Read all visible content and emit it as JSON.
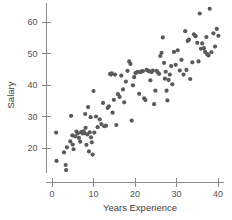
{
  "chart_data": {
    "type": "scatter",
    "title": "",
    "xlabel": "Years Experience",
    "ylabel": "Salary",
    "xlim": [
      -1.5,
      41.5
    ],
    "ylim": [
      12,
      66
    ],
    "xticks": [
      0,
      10,
      20,
      30,
      40
    ],
    "yticks": [
      20,
      30,
      40,
      50,
      60
    ],
    "xtick_labels": [
      "0",
      "10",
      "20",
      "30",
      "40"
    ],
    "ytick_labels": [
      "20",
      "30",
      "40",
      "50",
      "60"
    ],
    "grid": false,
    "legend": null,
    "marker": "circle",
    "marker_color": "#5a5a5a",
    "marker_size": 2.1,
    "n_points": 120,
    "points": [
      [
        1.0,
        24.9
      ],
      [
        1.1,
        15.9
      ],
      [
        2.9,
        18.6
      ],
      [
        3.3,
        14.6
      ],
      [
        3.4,
        13.0
      ],
      [
        3.6,
        20.2
      ],
      [
        4.4,
        22.1
      ],
      [
        4.6,
        30.2
      ],
      [
        4.9,
        24.0
      ],
      [
        5.0,
        21.1
      ],
      [
        5.2,
        19.6
      ],
      [
        5.6,
        23.7
      ],
      [
        5.9,
        25.2
      ],
      [
        6.2,
        24.6
      ],
      [
        6.5,
        23.2
      ],
      [
        6.8,
        22.0
      ],
      [
        7.0,
        25.0
      ],
      [
        7.2,
        25.1
      ],
      [
        7.4,
        24.6
      ],
      [
        7.6,
        25.3
      ],
      [
        7.8,
        24.7
      ],
      [
        8.0,
        30.8
      ],
      [
        8.1,
        26.4
      ],
      [
        8.3,
        21.0
      ],
      [
        8.5,
        24.3
      ],
      [
        8.7,
        33.0
      ],
      [
        8.9,
        18.9
      ],
      [
        9.1,
        25.0
      ],
      [
        9.3,
        29.8
      ],
      [
        9.4,
        23.4
      ],
      [
        9.6,
        21.8
      ],
      [
        9.8,
        17.9
      ],
      [
        10.0,
        38.1
      ],
      [
        10.2,
        24.9
      ],
      [
        10.6,
        30.0
      ],
      [
        11.0,
        26.6
      ],
      [
        11.5,
        29.1
      ],
      [
        11.9,
        27.6
      ],
      [
        12.3,
        34.3
      ],
      [
        12.6,
        26.9
      ],
      [
        13.0,
        27.1
      ],
      [
        13.4,
        32.7
      ],
      [
        13.7,
        33.2
      ],
      [
        14.0,
        43.5
      ],
      [
        14.2,
        43.3
      ],
      [
        14.4,
        43.7
      ],
      [
        14.6,
        31.2
      ],
      [
        14.9,
        35.3
      ],
      [
        15.2,
        43.3
      ],
      [
        15.5,
        27.3
      ],
      [
        15.9,
        37.1
      ],
      [
        16.3,
        36.2
      ],
      [
        16.7,
        43.0
      ],
      [
        17.1,
        38.6
      ],
      [
        17.4,
        34.5
      ],
      [
        17.8,
        41.1
      ],
      [
        18.2,
        44.5
      ],
      [
        18.6,
        47.5
      ],
      [
        18.9,
        46.7
      ],
      [
        19.2,
        28.7
      ],
      [
        19.5,
        39.9
      ],
      [
        19.8,
        42.5
      ],
      [
        20.1,
        43.8
      ],
      [
        20.4,
        44.0
      ],
      [
        20.7,
        44.2
      ],
      [
        21.0,
        37.2
      ],
      [
        21.3,
        44.1
      ],
      [
        21.6,
        44.3
      ],
      [
        21.9,
        44.4
      ],
      [
        22.2,
        35.8
      ],
      [
        22.5,
        35.2
      ],
      [
        22.8,
        44.8
      ],
      [
        23.1,
        44.6
      ],
      [
        23.4,
        44.3
      ],
      [
        23.7,
        41.5
      ],
      [
        24.0,
        44.1
      ],
      [
        24.3,
        44.6
      ],
      [
        24.6,
        33.9
      ],
      [
        24.9,
        38.2
      ],
      [
        25.2,
        44.5
      ],
      [
        25.5,
        44.0
      ],
      [
        25.8,
        43.5
      ],
      [
        26.1,
        49.2
      ],
      [
        26.4,
        50.2
      ],
      [
        26.7,
        55.1
      ],
      [
        27.0,
        47.0
      ],
      [
        27.2,
        42.0
      ],
      [
        27.4,
        44.2
      ],
      [
        27.6,
        38.2
      ],
      [
        27.8,
        35.1
      ],
      [
        28.1,
        41.6
      ],
      [
        28.4,
        43.3
      ],
      [
        28.7,
        46.0
      ],
      [
        29.0,
        40.2
      ],
      [
        29.4,
        50.5
      ],
      [
        29.8,
        46.4
      ],
      [
        30.3,
        51.0
      ],
      [
        30.8,
        44.6
      ],
      [
        31.2,
        48.0
      ],
      [
        31.7,
        43.3
      ],
      [
        32.1,
        57.1
      ],
      [
        32.4,
        44.8
      ],
      [
        32.7,
        54.0
      ],
      [
        33.0,
        54.4
      ],
      [
        33.3,
        41.9
      ],
      [
        33.8,
        47.2
      ],
      [
        34.2,
        56.1
      ],
      [
        34.6,
        55.5
      ],
      [
        35.0,
        53.4
      ],
      [
        35.3,
        47.5
      ],
      [
        35.6,
        62.7
      ],
      [
        35.9,
        51.5
      ],
      [
        36.2,
        53.2
      ],
      [
        36.6,
        51.7
      ],
      [
        36.9,
        50.5
      ],
      [
        37.2,
        55.2
      ],
      [
        37.4,
        49.8
      ],
      [
        37.7,
        49.4
      ],
      [
        38.0,
        64.2
      ],
      [
        38.4,
        50.4
      ],
      [
        38.9,
        56.4
      ],
      [
        39.3,
        52.2
      ],
      [
        39.7,
        57.8
      ],
      [
        40.1,
        55.6
      ]
    ]
  }
}
